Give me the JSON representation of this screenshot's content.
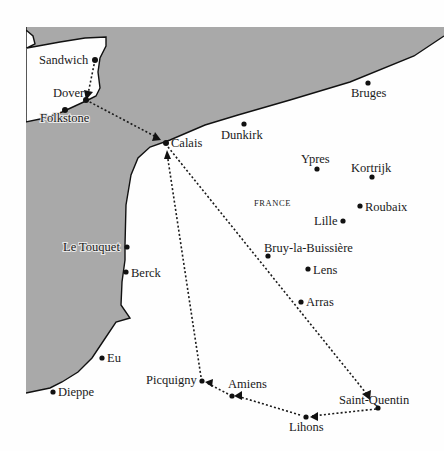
{
  "map": {
    "region_label": "FRANCE",
    "colors": {
      "sea": "#a9a9a9",
      "land": "#fefefe",
      "coast": "#111111",
      "route": "#1a1a1a"
    },
    "towns": [
      {
        "name": "Sandwich",
        "x": 95,
        "y": 60
      },
      {
        "name": "Dover",
        "x": 86,
        "y": 100
      },
      {
        "name": "Folkstone",
        "x": 65,
        "y": 110
      },
      {
        "name": "Calais",
        "x": 166,
        "y": 143
      },
      {
        "name": "Dunkirk",
        "x": 244,
        "y": 124
      },
      {
        "name": "Bruges",
        "x": 368,
        "y": 83
      },
      {
        "name": "Ypres",
        "x": 317,
        "y": 169
      },
      {
        "name": "Kortrijk",
        "x": 372,
        "y": 177
      },
      {
        "name": "Roubaix",
        "x": 360,
        "y": 206
      },
      {
        "name": "Lille",
        "x": 343,
        "y": 221
      },
      {
        "name": "Bruy-la-Buissière",
        "x": 268,
        "y": 256
      },
      {
        "name": "Lens",
        "x": 308,
        "y": 269
      },
      {
        "name": "Arras",
        "x": 301,
        "y": 302
      },
      {
        "name": "Le Touquet",
        "x": 127,
        "y": 247
      },
      {
        "name": "Berck",
        "x": 126,
        "y": 272
      },
      {
        "name": "Eu",
        "x": 102,
        "y": 358
      },
      {
        "name": "Dieppe",
        "x": 53,
        "y": 392
      },
      {
        "name": "Picquigny",
        "x": 202,
        "y": 381
      },
      {
        "name": "Amiens",
        "x": 232,
        "y": 396
      },
      {
        "name": "Saint-Quentin",
        "x": 378,
        "y": 408
      },
      {
        "name": "Lihons",
        "x": 306,
        "y": 417
      }
    ],
    "route": [
      "Sandwich",
      "Dover",
      "Calais",
      "Saint-Quentin",
      "Lihons",
      "Amiens",
      "Picquigny",
      "Calais"
    ]
  }
}
